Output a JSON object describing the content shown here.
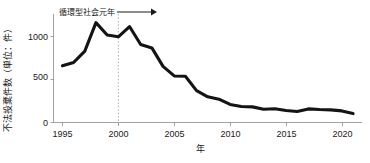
{
  "chart_data": {
    "type": "line",
    "title": "",
    "xlabel": "年",
    "ylabel": "不法投棄件数（単位：件）",
    "ylim": [
      0,
      1300
    ],
    "xlim": [
      1994.2,
      2021.8
    ],
    "grid": false,
    "legend": "none",
    "y_ticks": [
      0,
      500,
      1000
    ],
    "y_tick_labels": [
      "0",
      "500",
      "1000"
    ],
    "x_ticks": [
      1995,
      2000,
      2005,
      2010,
      2015,
      2020
    ],
    "x_tick_labels": [
      "1995",
      "2000",
      "2005",
      "2010",
      "2015",
      "2020"
    ],
    "series": [
      {
        "name": "不法投棄件数",
        "color": "#141414",
        "x": [
          1995,
          1996,
          1997,
          1998,
          1999,
          2000,
          2001,
          2002,
          2003,
          2004,
          2005,
          2006,
          2007,
          2008,
          2009,
          2010,
          2011,
          2012,
          2013,
          2014,
          2015,
          2016,
          2017,
          2018,
          2019,
          2020,
          2021
        ],
        "values": [
          679,
          719,
          855,
          1197,
          1049,
          1027,
          1150,
          934,
          894,
          673,
          558,
          554,
          382,
          308,
          279,
          216,
          192,
          187,
          159,
          165,
          143,
          131,
          163,
          155,
          151,
          139,
          107
        ]
      }
    ],
    "annotations": [
      {
        "name": "event-marker",
        "label": "循環型社会元年",
        "x": 2000,
        "arrow": "right"
      }
    ]
  }
}
